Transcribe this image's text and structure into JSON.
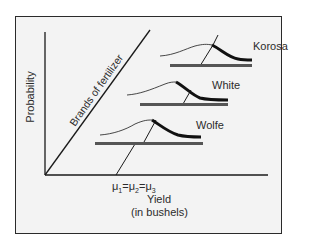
{
  "diagram": {
    "type": "probability distributions by brand",
    "y_axis_label": "Probability",
    "depth_axis_label": "Brands of fertilizer",
    "x_axis_label": "Yield",
    "x_axis_sublabel": "(in bushels)",
    "mean_annotation": {
      "symbol": "μ",
      "subscripts": [
        "1",
        "2",
        "3"
      ],
      "separator": "="
    },
    "brands": [
      {
        "name": "Korosa"
      },
      {
        "name": "White"
      },
      {
        "name": "Wolfe"
      }
    ],
    "colors": {
      "frame_background": "#f3f3f3",
      "lines": "#1a1a1a",
      "bars": "#555555"
    }
  }
}
